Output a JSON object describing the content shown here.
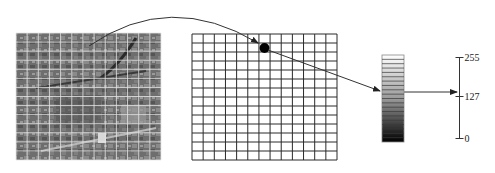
{
  "diagram": {
    "photo": {
      "label": "aerial-photo",
      "x": 16,
      "y": 33,
      "width": 145,
      "height": 127,
      "cols": 13,
      "rows": 14,
      "grid_color": "#e6e6e6",
      "base_color": "#6e6e6e"
    },
    "sampling_grid": {
      "x": 192,
      "y": 34,
      "width": 145,
      "height": 126,
      "cols": 13,
      "rows": 14,
      "line_color": "#2a2a2a",
      "sample_point": {
        "cx": 264.5,
        "cy": 48,
        "r": 5
      }
    },
    "gray_bar": {
      "x": 382,
      "y": 55,
      "width": 22,
      "height": 87,
      "bands": 20,
      "top_color": "#ffffff",
      "bottom_color": "#000000"
    },
    "scale": {
      "axis_x": 459.5,
      "top_y": 57.5,
      "bottom_y": 138.5,
      "ticks": [
        {
          "value": "255",
          "y": 57.5
        },
        {
          "value": "127",
          "y": 96.5
        },
        {
          "value": "0",
          "y": 138.5
        }
      ]
    },
    "arrows": {
      "photo_to_grid": {
        "path": "M 89 46 Q 170 -10 258 43"
      },
      "grid_to_bar": {
        "x1": 268,
        "y1": 50,
        "x2": 380,
        "y2": 91
      },
      "bar_to_scale": {
        "x1": 404,
        "y1": 92,
        "x2": 457,
        "y2": 92
      }
    }
  }
}
